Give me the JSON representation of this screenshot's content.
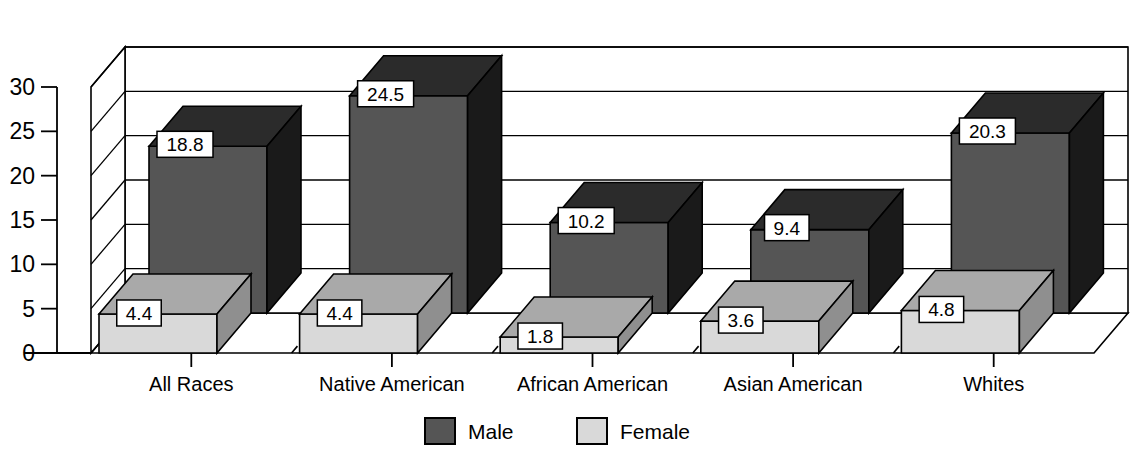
{
  "chart_data": {
    "type": "bar",
    "title": "",
    "subtitle": "",
    "xlabel": "",
    "ylabel": "",
    "ylim": [
      0,
      30
    ],
    "ytick_step": 5,
    "yticks": [
      "0",
      "5",
      "10",
      "15",
      "20",
      "25",
      "30"
    ],
    "grid": true,
    "three_d": true,
    "legend_position": "bottom-center",
    "categories": [
      "All Races",
      "Native American",
      "African American",
      "Asian American",
      "Whites"
    ],
    "series": [
      {
        "name": "Male",
        "values": [
          18.8,
          24.5,
          10.2,
          9.4,
          20.3
        ],
        "color": "#555555",
        "side_color": "#1a1a1a",
        "top_color": "#2b2b2b"
      },
      {
        "name": "Female",
        "values": [
          4.4,
          4.4,
          1.8,
          3.6,
          4.8
        ],
        "color": "#d9d9d9",
        "side_color": "#8f8f8f",
        "top_color": "#a9a9a9"
      }
    ],
    "data_labels": {
      "Male": [
        "18.8",
        "24.5",
        "10.2",
        "9.4",
        "20.3"
      ],
      "Female": [
        "4.4",
        "4.4",
        "1.8",
        "3.6",
        "4.8"
      ]
    }
  },
  "legend": {
    "items": [
      {
        "label": "Male",
        "swatch": "#555555"
      },
      {
        "label": "Female",
        "swatch": "#d9d9d9"
      }
    ]
  },
  "colors": {
    "male_front": "#555555",
    "male_side": "#1a1a1a",
    "male_top": "#2b2b2b",
    "female_front": "#d9d9d9",
    "female_side": "#8f8f8f",
    "female_top": "#a9a9a9",
    "axis": "#000000",
    "grid": "#000000",
    "background": "#ffffff",
    "label_box": "#ffffff"
  }
}
